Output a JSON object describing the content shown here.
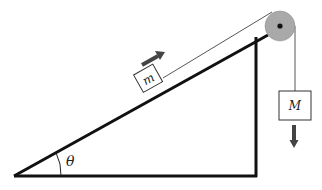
{
  "diagram": {
    "labels": {
      "small_mass": "m",
      "hanging_mass": "M",
      "angle": "θ"
    },
    "colors": {
      "line": "#111111",
      "rope": "#444444",
      "pulley_fill": "#a9a9a9",
      "arrow": "#444444",
      "box_fill": "#ffffff"
    },
    "arrows": [
      {
        "name": "m-motion",
        "direction": "up-incline"
      },
      {
        "name": "M-motion",
        "direction": "down"
      }
    ]
  }
}
